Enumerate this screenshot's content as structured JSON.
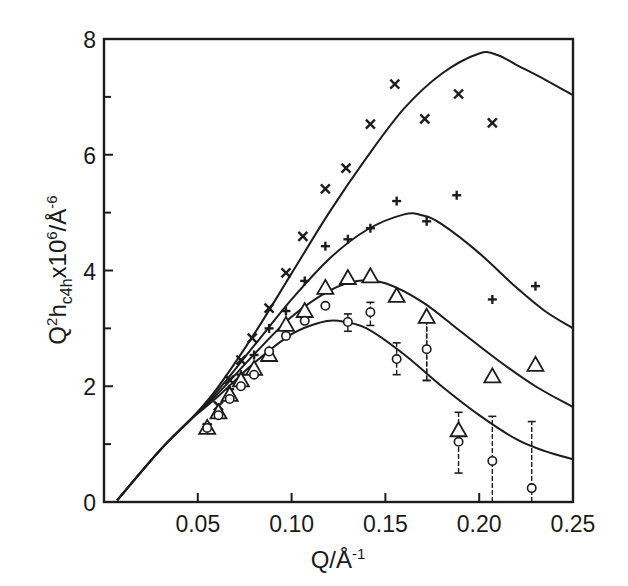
{
  "chart_data": {
    "type": "scatter",
    "title": "",
    "xlabel": "Q/Å-1",
    "ylabel": "Q2hc4hx106/Å-6",
    "xlabel_parts": {
      "base": "Q/Å",
      "sup": "-1"
    },
    "ylabel_parts": {
      "q": "Q",
      "q_sup": "2",
      "h": "h",
      "h_sub": "c4h",
      "x": "x10",
      "x_sup": "6",
      "unit": "/Å",
      "unit_sup": "-6"
    },
    "xlim": [
      0,
      0.25
    ],
    "ylim": [
      0,
      8
    ],
    "x_ticks": [
      0.05,
      0.1,
      0.15,
      0.2,
      0.25
    ],
    "x_tick_labels": [
      "0.05",
      "0.10",
      "0.15",
      "0.20",
      "0.25"
    ],
    "y_ticks": [
      0,
      2,
      4,
      6,
      8
    ],
    "y_tick_labels": [
      "0",
      "2",
      "4",
      "6",
      "8"
    ],
    "y_minor_ticks": [
      1,
      3,
      5,
      7
    ],
    "grid": false,
    "legend": null,
    "series": [
      {
        "name": "cross-x",
        "marker": "x",
        "points": [
          [
            0.055,
            1.28
          ],
          [
            0.061,
            1.66
          ],
          [
            0.067,
            2.11
          ],
          [
            0.073,
            2.45
          ],
          [
            0.079,
            2.83
          ],
          [
            0.088,
            3.35
          ],
          [
            0.097,
            3.96
          ],
          [
            0.106,
            4.59
          ],
          [
            0.118,
            5.41
          ],
          [
            0.129,
            5.77
          ],
          [
            0.142,
            6.53
          ],
          [
            0.155,
            7.22
          ],
          [
            0.171,
            6.62
          ],
          [
            0.189,
            7.05
          ],
          [
            0.207,
            6.55
          ]
        ],
        "fit_curve": [
          [
            0.007,
            0.03
          ],
          [
            0.03,
            0.9
          ],
          [
            0.046,
            1.42
          ],
          [
            0.06,
            1.95
          ],
          [
            0.08,
            2.9
          ],
          [
            0.1,
            3.95
          ],
          [
            0.12,
            5.0
          ],
          [
            0.14,
            5.95
          ],
          [
            0.16,
            6.8
          ],
          [
            0.18,
            7.4
          ],
          [
            0.2,
            7.75
          ],
          [
            0.21,
            7.72
          ],
          [
            0.22,
            7.55
          ],
          [
            0.235,
            7.3
          ],
          [
            0.25,
            7.03
          ]
        ]
      },
      {
        "name": "plus",
        "marker": "+",
        "points": [
          [
            0.055,
            1.28
          ],
          [
            0.061,
            1.6
          ],
          [
            0.067,
            1.95
          ],
          [
            0.073,
            2.2
          ],
          [
            0.08,
            2.54
          ],
          [
            0.088,
            3.0
          ],
          [
            0.097,
            3.3
          ],
          [
            0.107,
            3.82
          ],
          [
            0.118,
            4.42
          ],
          [
            0.13,
            4.54
          ],
          [
            0.142,
            4.73
          ],
          [
            0.156,
            5.2
          ],
          [
            0.172,
            4.85
          ],
          [
            0.188,
            5.3
          ],
          [
            0.207,
            3.5
          ],
          [
            0.23,
            3.73
          ]
        ],
        "fit_curve": [
          [
            0.007,
            0.03
          ],
          [
            0.03,
            0.9
          ],
          [
            0.046,
            1.42
          ],
          [
            0.06,
            1.9
          ],
          [
            0.08,
            2.7
          ],
          [
            0.1,
            3.5
          ],
          [
            0.12,
            4.2
          ],
          [
            0.14,
            4.7
          ],
          [
            0.16,
            4.97
          ],
          [
            0.17,
            4.95
          ],
          [
            0.18,
            4.8
          ],
          [
            0.2,
            4.3
          ],
          [
            0.22,
            3.7
          ],
          [
            0.235,
            3.3
          ],
          [
            0.25,
            3.0
          ]
        ]
      },
      {
        "name": "triangle",
        "marker": "triangle",
        "points": [
          [
            0.055,
            1.28
          ],
          [
            0.061,
            1.55
          ],
          [
            0.067,
            1.85
          ],
          [
            0.073,
            2.1
          ],
          [
            0.08,
            2.3
          ],
          [
            0.088,
            2.54
          ],
          [
            0.097,
            3.06
          ],
          [
            0.107,
            3.3
          ],
          [
            0.118,
            3.7
          ],
          [
            0.13,
            3.87
          ],
          [
            0.142,
            3.9
          ],
          [
            0.156,
            3.56
          ],
          [
            0.172,
            3.2
          ],
          [
            0.189,
            1.24
          ],
          [
            0.207,
            2.17
          ],
          [
            0.23,
            2.37
          ]
        ],
        "error_bars": [
          {
            "x": 0.172,
            "y_low": 2.1,
            "y_high": 3.2
          }
        ],
        "fit_curve": [
          [
            0.007,
            0.03
          ],
          [
            0.03,
            0.9
          ],
          [
            0.046,
            1.42
          ],
          [
            0.06,
            1.85
          ],
          [
            0.08,
            2.55
          ],
          [
            0.1,
            3.2
          ],
          [
            0.12,
            3.65
          ],
          [
            0.135,
            3.82
          ],
          [
            0.15,
            3.78
          ],
          [
            0.17,
            3.45
          ],
          [
            0.19,
            2.95
          ],
          [
            0.21,
            2.45
          ],
          [
            0.23,
            2.0
          ],
          [
            0.25,
            1.64
          ]
        ]
      },
      {
        "name": "circle",
        "marker": "circle",
        "points": [
          [
            0.055,
            1.28
          ],
          [
            0.061,
            1.5
          ],
          [
            0.067,
            1.78
          ],
          [
            0.073,
            2.0
          ],
          [
            0.08,
            2.2
          ],
          [
            0.088,
            2.6
          ],
          [
            0.097,
            2.87
          ],
          [
            0.107,
            3.13
          ],
          [
            0.118,
            3.39
          ],
          [
            0.13,
            3.11
          ],
          [
            0.142,
            3.28
          ],
          [
            0.156,
            2.47
          ],
          [
            0.172,
            2.64
          ],
          [
            0.189,
            1.04
          ],
          [
            0.207,
            0.71
          ],
          [
            0.228,
            0.24
          ]
        ],
        "error_bars": [
          {
            "x": 0.13,
            "y_low": 2.95,
            "y_high": 3.25
          },
          {
            "x": 0.142,
            "y_low": 3.05,
            "y_high": 3.45
          },
          {
            "x": 0.156,
            "y_low": 2.2,
            "y_high": 2.75
          },
          {
            "x": 0.172,
            "y_low": 2.1,
            "y_high": 3.2
          },
          {
            "x": 0.189,
            "y_low": 0.5,
            "y_high": 1.55
          },
          {
            "x": 0.207,
            "y_low": 0.0,
            "y_high": 1.48
          },
          {
            "x": 0.228,
            "y_low": 0.0,
            "y_high": 1.39
          }
        ],
        "fit_curve": [
          [
            0.007,
            0.03
          ],
          [
            0.03,
            0.9
          ],
          [
            0.046,
            1.42
          ],
          [
            0.06,
            1.8
          ],
          [
            0.08,
            2.4
          ],
          [
            0.1,
            2.9
          ],
          [
            0.115,
            3.1
          ],
          [
            0.125,
            3.13
          ],
          [
            0.14,
            3.0
          ],
          [
            0.16,
            2.55
          ],
          [
            0.18,
            2.0
          ],
          [
            0.2,
            1.5
          ],
          [
            0.22,
            1.08
          ],
          [
            0.235,
            0.88
          ],
          [
            0.25,
            0.74
          ]
        ]
      }
    ]
  }
}
